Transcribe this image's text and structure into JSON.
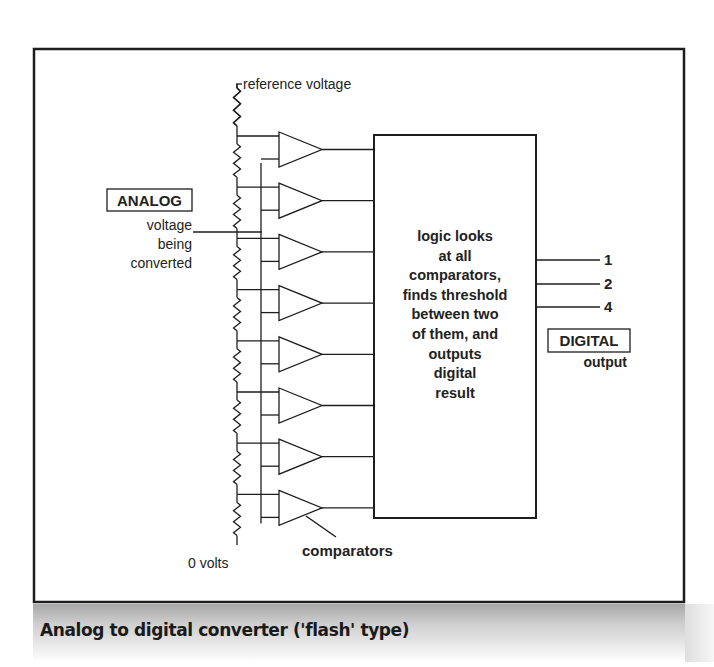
{
  "figure": {
    "caption": "Analog to digital converter ('flash' type)"
  },
  "diagram": {
    "reference_label": "reference voltage",
    "ground_label": "0 volts",
    "analog_box_label": "ANALOG",
    "analog_desc": [
      "voltage",
      "being",
      "converted"
    ],
    "comparators_label": "comparators",
    "comparator_count": 8,
    "logic_text": [
      "logic looks",
      "at all",
      "comparators,",
      "finds threshold",
      "between two",
      "of them, and",
      "outputs",
      "digital",
      "result"
    ],
    "outputs": [
      "1",
      "2",
      "4"
    ],
    "digital_box_label": "DIGITAL",
    "digital_desc": "output"
  },
  "colors": {
    "line": "#1e1e1e",
    "text": "#222222",
    "caption_band_top": "#a8a8a8",
    "background": "#ffffff"
  }
}
